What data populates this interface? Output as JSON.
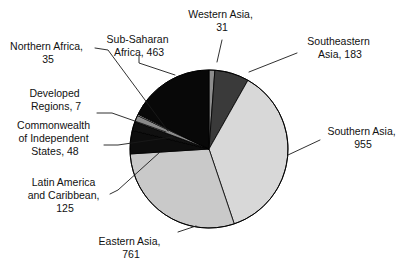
{
  "chart_data": {
    "type": "pie",
    "title": "",
    "subtitle": "",
    "xlabel": "",
    "ylabel": "",
    "total": 2608,
    "legend_position": "none",
    "grid": false,
    "label_format": "{name}, {value}",
    "start_angle_deg": 0,
    "direction": "clockwise",
    "categories": [
      "Western Asia",
      "Southeastern Asia",
      "Southern Asia",
      "Eastern Asia",
      "Latin America and Caribbean",
      "Commonwealth of Independent States",
      "Northern Africa",
      "Developed Regions",
      "Sub-Saharan Africa"
    ],
    "values": [
      31,
      183,
      955,
      761,
      125,
      48,
      35,
      7,
      463
    ],
    "colors": [
      "#8d8d8d",
      "#3a3a3a",
      "#d8d8d8",
      "#c9c9c9",
      "#0d0d0d",
      "#111111",
      "#8a8a8a",
      "#e2e2e2",
      "#080808"
    ],
    "slices": [
      {
        "name": "Western Asia",
        "value": 31,
        "color": "#8d8d8d",
        "label": "Western Asia,",
        "value_label": "31"
      },
      {
        "name": "Southeastern Asia",
        "value": 183,
        "color": "#3a3a3a",
        "label": "Southeastern",
        "label2": "Asia, 183",
        "value_label": "183"
      },
      {
        "name": "Southern Asia",
        "value": 955,
        "color": "#d8d8d8",
        "label": "Southern Asia,",
        "value_label": "955"
      },
      {
        "name": "Eastern Asia",
        "value": 761,
        "color": "#c9c9c9",
        "label": "Eastern Asia,",
        "value_label": "761"
      },
      {
        "name": "Latin America and Caribbean",
        "value": 125,
        "color": "#0d0d0d",
        "label": "Latin America",
        "label2": "and Caribbean,",
        "value_label": "125"
      },
      {
        "name": "Commonwealth of Independent States",
        "value": 48,
        "color": "#111111",
        "label": "Commonwealth",
        "label2": "of Independent",
        "label3": "States, 48",
        "value_label": "48"
      },
      {
        "name": "Northern Africa",
        "value": 35,
        "color": "#8a8a8a",
        "label": "Northern Africa,",
        "value_label": "35"
      },
      {
        "name": "Developed Regions",
        "value": 7,
        "color": "#e2e2e2",
        "label": "Developed",
        "label2": "Regions, 7",
        "value_label": "7"
      },
      {
        "name": "Sub-Saharan Africa",
        "value": 463,
        "color": "#080808",
        "label": "Sub-Saharan",
        "label2": "Africa, 463",
        "value_label": "463"
      }
    ]
  },
  "labels": {
    "western_asia_l1": "Western Asia,",
    "western_asia_l2": "31",
    "southeastern_asia_l1": "Southeastern",
    "southeastern_asia_l2": "Asia, 183",
    "southern_asia_l1": "Southern Asia,",
    "southern_asia_l2": "955",
    "eastern_asia_l1": "Eastern Asia,",
    "eastern_asia_l2": "761",
    "latin_america_l1": "Latin America",
    "latin_america_l2": "and Caribbean,",
    "latin_america_l3": "125",
    "cis_l1": "Commonwealth",
    "cis_l2": "of Independent",
    "cis_l3": "States, 48",
    "developed_l1": "Developed",
    "developed_l2": "Regions, 7",
    "northern_africa_l1": "Northern Africa,",
    "northern_africa_l2": "35",
    "subsaharan_l1": "Sub-Saharan",
    "subsaharan_l2": "Africa, 463"
  },
  "style": {
    "background": "#ffffff",
    "outline": "#000000",
    "text": "#111111"
  }
}
